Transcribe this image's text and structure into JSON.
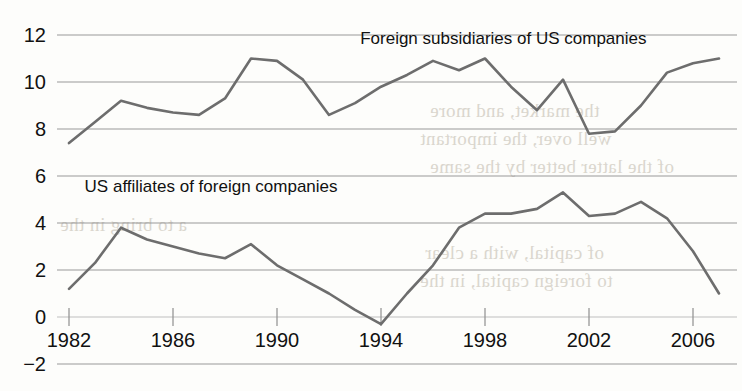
{
  "chart_data": {
    "type": "line",
    "title": "",
    "xlabel": "",
    "ylabel": "",
    "xlim": [
      1982,
      2007
    ],
    "ylim": [
      -2,
      12
    ],
    "grid": true,
    "gridlines_y": [
      12,
      10,
      8,
      6,
      4,
      2,
      0,
      -2
    ],
    "y_ticklabels": [
      "12",
      "10",
      "8",
      "6",
      "4",
      "2",
      "0",
      "−2"
    ],
    "x_ticks": [
      1982,
      1986,
      1990,
      1994,
      1998,
      2002,
      2006
    ],
    "x_ticklabels": [
      "1982",
      "1986",
      "1990",
      "1994",
      "1998",
      "2002",
      "2006"
    ],
    "legend": "annotations-inline",
    "line_color": "#6d6d6d",
    "grid_color": "#8f8f8f",
    "x": [
      1982,
      1983,
      1984,
      1985,
      1986,
      1987,
      1988,
      1989,
      1990,
      1991,
      1992,
      1993,
      1994,
      1995,
      1996,
      1997,
      1998,
      1999,
      2000,
      2001,
      2002,
      2003,
      2004,
      2005,
      2006,
      2007
    ],
    "series": [
      {
        "name": "Foreign subsidiaries of US companies",
        "label_x": 1993.2,
        "label_y": 11.6,
        "values": [
          7.4,
          8.3,
          9.2,
          8.9,
          8.7,
          8.6,
          9.3,
          11.0,
          10.9,
          10.1,
          8.6,
          9.1,
          9.8,
          10.3,
          10.9,
          10.5,
          11.0,
          9.8,
          8.8,
          10.1,
          7.8,
          7.9,
          9.0,
          10.4,
          10.8,
          11.0
        ]
      },
      {
        "name": "US affiliates of foreign companies",
        "label_x": 1982.6,
        "label_y": 5.3,
        "values": [
          1.2,
          2.3,
          3.8,
          3.3,
          3.0,
          2.7,
          2.5,
          3.1,
          2.2,
          1.6,
          1.0,
          0.3,
          -0.3,
          1.0,
          2.2,
          3.8,
          4.4,
          4.4,
          4.6,
          5.3,
          4.3,
          4.4,
          4.9,
          4.2,
          2.8,
          1.0
        ]
      }
    ]
  },
  "axis": {
    "y_title": "",
    "x_title": ""
  },
  "bleed_text": {
    "lines": [
      "the market, and more",
      "well over, the important",
      "of the latter better by the same",
      "of capital, with a clear",
      "to foreign capital, in the",
      "a to bring in the"
    ]
  }
}
